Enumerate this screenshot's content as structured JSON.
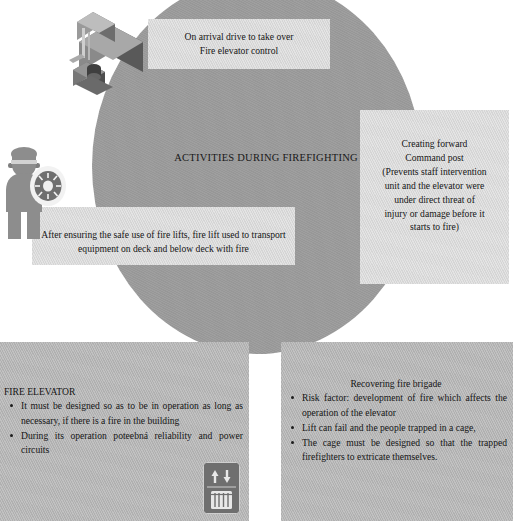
{
  "slide": {
    "center_label": "ACTIVITIES DURING FIREFIGHTING",
    "colors": {
      "background": "#ffffff",
      "ellipse_fill": "#9c9c9c",
      "callout_fill": "#d9d9d9",
      "panel_fill": "#b4b4b4",
      "text": "#161616"
    }
  },
  "callouts": {
    "arrival": {
      "line1": "On arrival drive to take over",
      "line2": "Fire elevator control"
    },
    "command_post": {
      "line1": "Creating forward",
      "line2": "Command post",
      "line3": "(Prevents staff intervention",
      "line4": "unit and the elevator were",
      "line5": "under direct threat of",
      "line6": "injury or damage before it",
      "line7": "starts to fire)"
    },
    "fire_lifts": {
      "line1": "After ensuring the safe use of fire lifts, fire lift used to transport",
      "line2": "equipment on deck and below deck with fire"
    }
  },
  "panels": {
    "left": {
      "heading": "FIRE ELEVATOR",
      "bullets": [
        "It must be designed so as to be in operation as long as necessary, if there is a fire in the building",
        "During its operation poteebná reliability and power circuits"
      ]
    },
    "right": {
      "heading": "Recovering fire brigade",
      "bullets": [
        "Risk factor: development of fire which affects the operation of the elevator",
        "Lift can fail and the people trapped in a cage,",
        "The cage must be designed so that the trapped firefighters to extricate themselves."
      ]
    }
  },
  "graphics": {
    "machine_room": "elevator-machine-room-illustration",
    "officer": "firefighter-officer-figure",
    "badge": "fire-service-badge-emblem",
    "elevator_sign": "elevator-sign-icon"
  }
}
